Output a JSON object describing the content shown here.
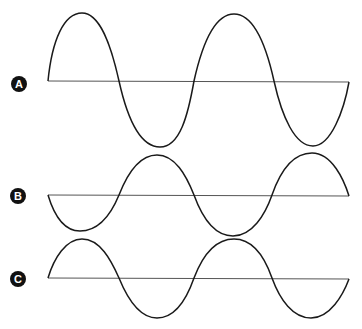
{
  "diagram": {
    "waves": [
      {
        "label": "A",
        "phase": "starts rising (0°)",
        "baseline_y": 81,
        "amplitude": 67,
        "cycles": 2
      },
      {
        "label": "B",
        "phase": "starts falling (180°)",
        "baseline_y": 195,
        "amplitude": 40,
        "cycles": 2
      },
      {
        "label": "C",
        "phase": "starts rising (0°)",
        "baseline_y": 278,
        "amplitude": 40,
        "cycles": 2
      }
    ],
    "colors": {
      "wave": "#1a1a1a",
      "axis": "#555555",
      "label_bg": "#111111",
      "label_text": "#ffffff"
    }
  }
}
